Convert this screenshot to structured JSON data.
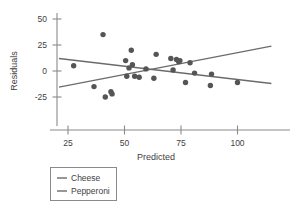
{
  "chart_data": {
    "type": "scatter",
    "title": "",
    "xlabel": "Predicted",
    "ylabel": "Residuals",
    "xlim": [
      20,
      116
    ],
    "ylim": [
      -37,
      56
    ],
    "xticks": [
      25,
      50,
      75,
      100
    ],
    "xtick_labels": [
      "25",
      "50",
      "75",
      "100"
    ],
    "yticks": [
      50,
      25,
      0,
      -25
    ],
    "ytick_labels": [
      "50",
      "25",
      "0",
      "-25"
    ],
    "grid": false,
    "legend_position": "below-left",
    "point_color": "#555555",
    "line_color": "#6b6b6b",
    "axis_color": "#7a7a7a",
    "points": [
      {
        "x": 27.5,
        "y": 5
      },
      {
        "x": 36.5,
        "y": -15
      },
      {
        "x": 40.5,
        "y": 35
      },
      {
        "x": 41.5,
        "y": -25
      },
      {
        "x": 44.0,
        "y": -20
      },
      {
        "x": 44.5,
        "y": -22
      },
      {
        "x": 50.5,
        "y": 10
      },
      {
        "x": 51.0,
        "y": -5
      },
      {
        "x": 52.0,
        "y": 3
      },
      {
        "x": 53.0,
        "y": 20
      },
      {
        "x": 53.5,
        "y": 6
      },
      {
        "x": 54.5,
        "y": -5
      },
      {
        "x": 56.5,
        "y": -6
      },
      {
        "x": 59.5,
        "y": 2
      },
      {
        "x": 63.0,
        "y": -7
      },
      {
        "x": 64.0,
        "y": 16
      },
      {
        "x": 70.5,
        "y": 12
      },
      {
        "x": 71.5,
        "y": 1
      },
      {
        "x": 73.0,
        "y": 11
      },
      {
        "x": 74.0,
        "y": 9
      },
      {
        "x": 74.5,
        "y": 10
      },
      {
        "x": 77.0,
        "y": -11
      },
      {
        "x": 79.0,
        "y": 8
      },
      {
        "x": 81.0,
        "y": -2
      },
      {
        "x": 88.0,
        "y": -14
      },
      {
        "x": 88.5,
        "y": -3
      },
      {
        "x": 100.0,
        "y": -11
      }
    ],
    "series": [
      {
        "name": "Cheese",
        "type": "trendline",
        "slope": -0.255,
        "x_start": 21.0,
        "y_start": 12.0,
        "x_end": 115.0,
        "y_end": -12.0
      },
      {
        "name": "Pepperoni",
        "type": "trendline",
        "slope": 0.415,
        "x_start": 21.0,
        "y_start": -15.5,
        "x_end": 115.0,
        "y_end": 24.0
      }
    ]
  },
  "legend": {
    "items": [
      {
        "label": "Cheese",
        "swatch": "line-swatch"
      },
      {
        "label": "Pepperoni",
        "swatch": "line-swatch"
      }
    ]
  }
}
